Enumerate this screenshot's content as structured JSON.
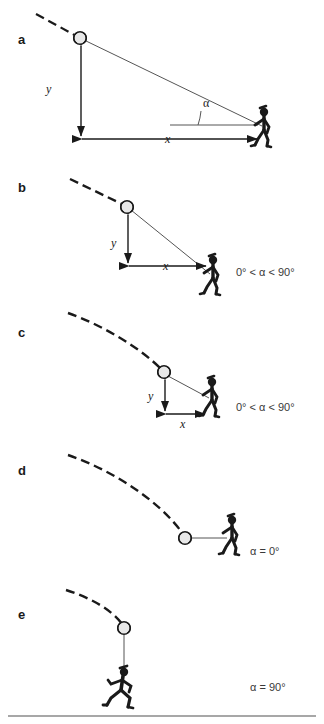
{
  "figure": {
    "background": "#ffffff",
    "ink": "#1a1a1a",
    "line_gray": "#555555",
    "panels": [
      {
        "id": "a",
        "label": "a",
        "label_pos": [
          18,
          32
        ],
        "annotation": "",
        "annotation_pos": [
          0,
          0
        ],
        "ball": [
          80,
          38
        ],
        "runner": [
          264,
          130
        ],
        "runner_pose": "walking",
        "y_label": "y",
        "y_label_pos": [
          46,
          82
        ],
        "x_label": "x",
        "x_label_pos": [
          165,
          134
        ],
        "alpha_label": "α",
        "alpha_label_pos": [
          205,
          97
        ],
        "trajectory": "M 36 14 L 80 38",
        "sightline": "M 80 38 L 262 125",
        "y_arrow": {
          "x": 81,
          "y1": 44,
          "y2": 135
        },
        "x_arrow": {
          "y": 139,
          "x1": 81,
          "x2": 258
        },
        "alpha_base": {
          "y": 125,
          "x1": 170,
          "x2": 258
        },
        "alpha_arc": {
          "cx": 258,
          "cy": 125,
          "r": 62,
          "a1": 205,
          "a2": 180
        }
      },
      {
        "id": "b",
        "label": "b",
        "label_pos": [
          18,
          180
        ],
        "annotation": "0° < α < 90°",
        "annotation_pos": [
          236,
          273
        ],
        "ball": [
          127,
          207
        ],
        "runner": [
          213,
          278
        ],
        "runner_pose": "walking",
        "y_label": "y",
        "y_label_pos": [
          111,
          243
        ],
        "x_label": "x",
        "x_label_pos": [
          163,
          271
        ],
        "alpha_label": "",
        "alpha_label_pos": [
          0,
          0
        ],
        "trajectory": "M 70 179 L 127 207",
        "sightline": "M 127 207 L 211 274",
        "y_arrow": {
          "x": 128,
          "y1": 213,
          "y2": 262
        },
        "x_arrow": {
          "y": 266,
          "x1": 128,
          "x2": 207
        },
        "alpha_base": null,
        "alpha_arc": null
      },
      {
        "id": "c",
        "label": "c",
        "label_pos": [
          18,
          325
        ],
        "annotation": "0° < α < 90°",
        "annotation_pos": [
          236,
          408
        ],
        "ball": [
          164,
          372
        ],
        "runner": [
          212,
          400
        ],
        "runner_pose": "walking",
        "y_label": "y",
        "y_label_pos": [
          148,
          398
        ],
        "x_label": "x",
        "x_label_pos": [
          180,
          426
        ],
        "alpha_label": "",
        "alpha_label_pos": [
          0,
          0
        ],
        "trajectory": "M 68 313 C 100 324, 140 350, 164 372",
        "sightline": "M 164 372 L 210 398",
        "y_arrow": {
          "x": 165,
          "y1": 378,
          "y2": 410
        },
        "x_arrow": {
          "y": 414,
          "x1": 165,
          "x2": 206
        },
        "alpha_base": null,
        "alpha_arc": null
      },
      {
        "id": "d",
        "label": "d",
        "label_pos": [
          18,
          463
        ],
        "annotation": "α = 0°",
        "annotation_pos": [
          250,
          552
        ],
        "ball": [
          185,
          538
        ],
        "runner": [
          230,
          538
        ],
        "runner_pose": "walking",
        "y_label": "",
        "y_label_pos": [
          0,
          0
        ],
        "x_label": "",
        "x_label_pos": [
          0,
          0
        ],
        "alpha_label": "",
        "alpha_label_pos": [
          0,
          0
        ],
        "trajectory": "M 68 455 C 110 468, 160 500, 185 536",
        "sightline": "M 192 538 L 227 538",
        "y_arrow": null,
        "x_arrow": null,
        "alpha_base": null,
        "alpha_arc": null
      },
      {
        "id": "e",
        "label": "e",
        "label_pos": [
          18,
          607
        ],
        "annotation": "α = 90°",
        "annotation_pos": [
          250,
          688
        ],
        "ball": [
          124,
          628
        ],
        "runner": [
          122,
          692
        ],
        "runner_pose": "running",
        "y_label": "",
        "y_label_pos": [
          0,
          0
        ],
        "x_label": "",
        "x_label_pos": [
          0,
          0
        ],
        "alpha_label": "",
        "alpha_label_pos": [
          0,
          0
        ],
        "trajectory": "M 66 590 C 86 596, 110 608, 124 626",
        "sightline": "M 124 634 L 124 676",
        "y_arrow": null,
        "x_arrow": null,
        "alpha_base": null,
        "alpha_arc": null
      }
    ],
    "bottom_rule": {
      "y": 716,
      "x1": 8,
      "x2": 316
    }
  }
}
